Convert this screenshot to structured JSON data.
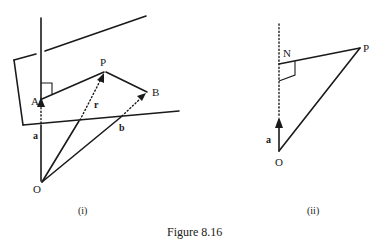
{
  "figure": {
    "caption": "Figure 8.16",
    "panels": [
      {
        "id": "i",
        "label": "(i)",
        "points": {
          "O": "O",
          "A": "A",
          "P": "P",
          "B": "B"
        },
        "vectors": {
          "a": "a",
          "r": "r",
          "b": "b"
        },
        "description": "Line through A perpendicular to plane containing A, P, B; position vectors a, r, b from origin O"
      },
      {
        "id": "ii",
        "label": "(ii)",
        "points": {
          "O": "O",
          "N": "N",
          "P": "P"
        },
        "vectors": {
          "a": "a"
        },
        "description": "Perpendicular from P to line through O in direction a meets at N; right angle at N"
      }
    ]
  }
}
